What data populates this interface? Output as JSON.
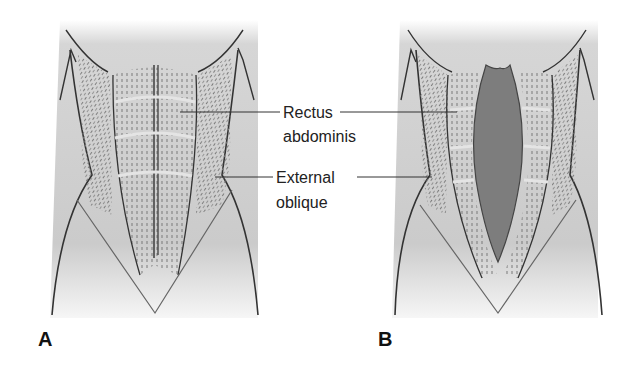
{
  "figure": {
    "panels": [
      {
        "id": "A",
        "label": "A",
        "state": "normal abdominal wall"
      },
      {
        "id": "B",
        "label": "B",
        "state": "separated rectus abdominis with central gap"
      }
    ],
    "callouts": [
      {
        "line1": "Rectus",
        "line2": "abdominis"
      },
      {
        "line1": "External",
        "line2": "oblique"
      }
    ],
    "colors": {
      "skin_shade": "#c9c9c9",
      "outline": "#333333",
      "gap_fill": "#7d7d7d",
      "muscle_dash": "#777777",
      "background": "#ffffff"
    }
  }
}
